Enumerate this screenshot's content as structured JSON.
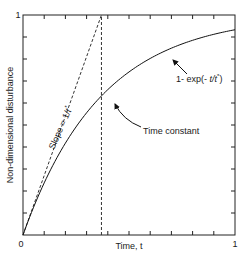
{
  "chart_data": {
    "type": "line",
    "title": "",
    "xlabel": "Time, t",
    "ylabel": "Non-dimensional disturbance",
    "xlim": [
      0,
      1
    ],
    "ylim": [
      0,
      1
    ],
    "x_tick_labels": [
      "0",
      "1"
    ],
    "y_tick_labels": [
      "1"
    ],
    "tick_spacing": 0.1,
    "grid": false,
    "time_constant": 0.37,
    "series": [
      {
        "name": "1- exp(- t/t*)",
        "style": "solid",
        "x": [
          0,
          0.1,
          0.2,
          0.3,
          0.37,
          0.4,
          0.5,
          0.6,
          0.7,
          0.8,
          0.9,
          1.0
        ],
        "y": [
          0,
          0.237,
          0.418,
          0.556,
          0.632,
          0.661,
          0.741,
          0.802,
          0.849,
          0.885,
          0.912,
          0.933
        ]
      },
      {
        "name": "Slope = 1/t*",
        "style": "dashed",
        "x": [
          0,
          0.37
        ],
        "y": [
          0,
          1
        ]
      },
      {
        "name": "Time constant marker",
        "style": "dashed",
        "x": [
          0.37,
          0.37
        ],
        "y": [
          0,
          1
        ]
      }
    ],
    "annotations": [
      {
        "text": "1- exp(- t/t*)",
        "points_to": [
          0.55,
          0.75
        ]
      },
      {
        "text": "Time constant",
        "points_to": [
          0.37,
          0.632
        ]
      },
      {
        "text": "Slope = 1/t*",
        "rotated": true
      }
    ]
  },
  "labels": {
    "y_axis": "Non-dimensional disturbance",
    "x_axis": "Time, t",
    "x_zero": "0",
    "x_one": "1",
    "y_one": "1",
    "curve_label_prefix": "1- exp(- ",
    "curve_label_var": "t/t",
    "curve_label_star": "*",
    "curve_label_suffix": ")",
    "time_constant": "Time constant",
    "slope_prefix": "Slope = 1/",
    "slope_var": "t",
    "slope_star": "*"
  }
}
